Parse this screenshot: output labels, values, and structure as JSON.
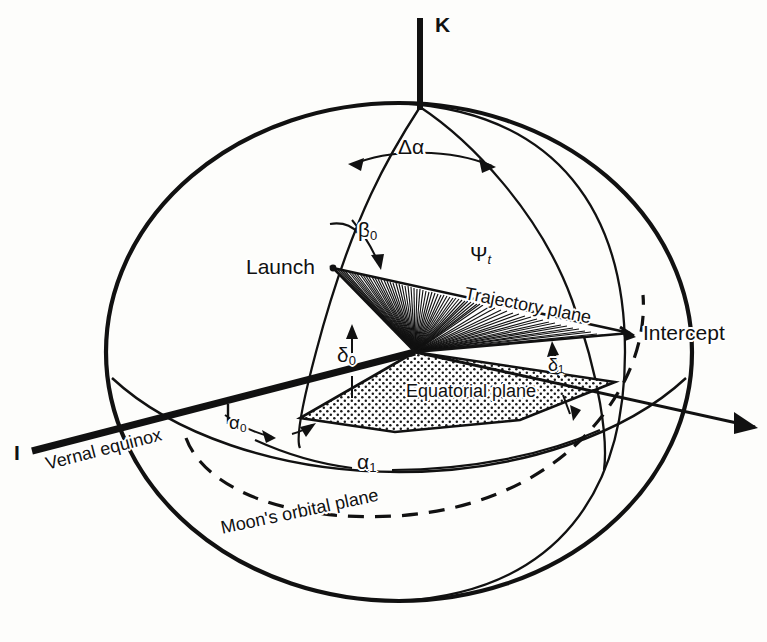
{
  "figure": {
    "kind": "celestial-sphere-geometry-diagram",
    "background_color": "#fdfdfb",
    "ink_color": "#111111"
  },
  "axes": {
    "k_label": "K",
    "i_label": "I"
  },
  "points": {
    "launch_label": "Launch",
    "intercept_label": "Intercept"
  },
  "planes": {
    "trajectory_label": "Trajectory plane",
    "equatorial_label": "Equatorial plane",
    "moon_orbit_label": "Moon's orbital plane",
    "vernal_equinox_label": "Vernal equinox"
  },
  "angles": {
    "delta_alpha": "Δα",
    "beta_0_base": "β",
    "beta_0_sub": "0",
    "delta_0_base": "δ",
    "delta_0_sub": "0",
    "delta_1_base": "δ",
    "delta_1_sub": "1",
    "alpha_0_base": "α",
    "alpha_0_sub": "0",
    "alpha_1_base": "α",
    "alpha_1_sub": "1",
    "psi_t_base": "Ψ",
    "psi_t_sub": "t"
  }
}
